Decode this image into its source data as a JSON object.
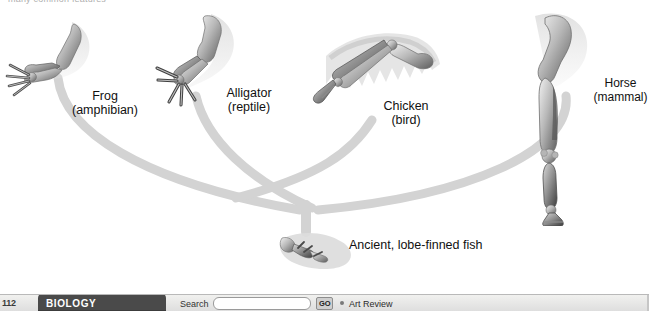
{
  "figure": {
    "top_caption_fragment": "many common features",
    "ancestor_label": "Ancient, lobe-finned fish",
    "branch_color": "#d2d2d2",
    "background_color": "#ffffff",
    "specimens": [
      {
        "id": "frog",
        "name": "Frog",
        "group": "(amphibian)",
        "art": "frog-forelimb-bones"
      },
      {
        "id": "alligator",
        "name": "Alligator",
        "group": "(reptile)",
        "art": "alligator-forelimb-bones"
      },
      {
        "id": "chicken",
        "name": "Chicken",
        "group": "(bird)",
        "art": "chicken-wing-bones"
      },
      {
        "id": "horse",
        "name": "Horse",
        "group": "(mammal)",
        "art": "horse-foreleg-bones"
      }
    ]
  },
  "toolbar": {
    "page_number": "112",
    "book_tab_label": "BIOLOGY",
    "search_label": "Search",
    "search_value": "",
    "search_placeholder": "",
    "go_label": "GO",
    "art_review_label": "Art Review"
  }
}
